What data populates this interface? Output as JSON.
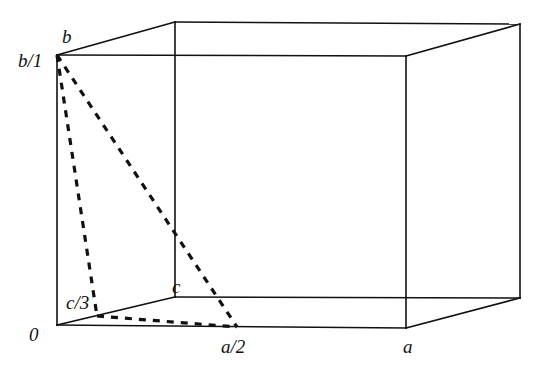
{
  "figure": {
    "background_color": "#ffffff",
    "line_color": "#111111",
    "solid_line_width": 1.6,
    "dashed_line_width": 3.2,
    "dash_pattern": "7 7"
  },
  "cell": {
    "front_face": {
      "top_left": [
        57,
        55
      ],
      "top_right": [
        406,
        56
      ],
      "bottom_right": [
        406,
        328
      ],
      "bottom_left": [
        57,
        325
      ]
    },
    "back_face": {
      "top_left": [
        175,
        22
      ],
      "top_right": [
        520,
        24
      ],
      "bottom_right": [
        520,
        298
      ],
      "bottom_left": [
        175,
        297
      ]
    }
  },
  "plane": {
    "name": "dashed-intercept-triangle",
    "vertices": [
      [
        57,
        55
      ],
      [
        97,
        316
      ],
      [
        237,
        327
      ]
    ],
    "intercepts": [
      "b/1",
      "c/3",
      "a/2"
    ]
  },
  "labels": {
    "b": {
      "text": "b",
      "x": 62,
      "y": 27
    },
    "b_over_1": {
      "text": "b/1",
      "x": 18,
      "y": 51
    },
    "c_over_3": {
      "text": "c/3",
      "x": 66,
      "y": 293
    },
    "c": {
      "text": "c",
      "x": 172,
      "y": 277
    },
    "origin": {
      "text": "0",
      "x": 29,
      "y": 325
    },
    "a_over_2": {
      "text": "a/2",
      "x": 221,
      "y": 337
    },
    "a": {
      "text": "a",
      "x": 403,
      "y": 337
    }
  },
  "axes": [
    {
      "symbol": "a",
      "intercept_label": "a/2",
      "direction": "right along front-bottom edge"
    },
    {
      "symbol": "b",
      "intercept_label": "b/1",
      "direction": "up along front-left vertical edge"
    },
    {
      "symbol": "c",
      "intercept_label": "c/3",
      "direction": "back-right along bottom-left edge"
    }
  ]
}
